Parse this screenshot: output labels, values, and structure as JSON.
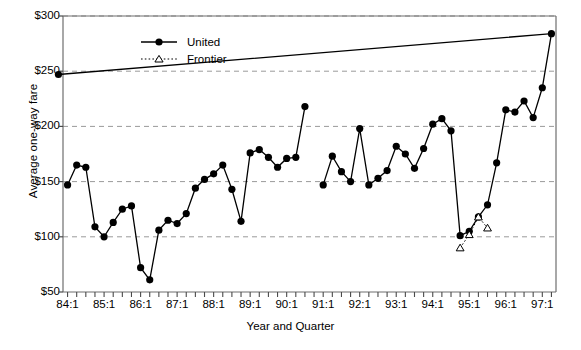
{
  "chart_data": {
    "type": "line",
    "title": "",
    "xlabel": "Year and Quarter",
    "ylabel": "Average one-way fare",
    "ylim": [
      50,
      300
    ],
    "yticks": [
      50,
      100,
      150,
      200,
      250,
      300
    ],
    "ytick_labels": [
      "$50",
      "$100",
      "$150",
      "$200",
      "$250",
      "$300"
    ],
    "grid": "horizontal-dashed",
    "legend_position": "top-center",
    "x_tick_labels": [
      "84:1",
      "85:1",
      "86:1",
      "87:1",
      "88:1",
      "89:1",
      "90:1",
      "91:1",
      "92:1",
      "93:1",
      "94:1",
      "95:1",
      "96:1",
      "97:1"
    ],
    "x_categories": [
      "84:1",
      "84:2",
      "84:3",
      "84:4",
      "85:1",
      "85:2",
      "85:3",
      "85:4",
      "86:1",
      "86:2",
      "86:3",
      "86:4",
      "87:1",
      "87:2",
      "87:3",
      "87:4",
      "88:1",
      "88:2",
      "88:3",
      "88:4",
      "89:1",
      "89:2",
      "89:3",
      "89:4",
      "90:1",
      "90:2",
      "90:3",
      "90:4",
      "91:1",
      "91:2",
      "91:3",
      "91:4",
      "92:1",
      "92:2",
      "92:3",
      "92:4",
      "93:1",
      "93:2",
      "93:3",
      "93:4",
      "94:1",
      "94:2",
      "94:3",
      "94:4",
      "95:1",
      "95:2",
      "95:3",
      "95:4",
      "96:1",
      "96:2",
      "96:3",
      "96:4",
      "97:1",
      "97:2"
    ],
    "series": [
      {
        "name": "United",
        "marker": "filled-circle",
        "line": "solid",
        "color": "#000000",
        "points": [
          {
            "x": "84:1",
            "y": 147
          },
          {
            "x": "84:2",
            "y": 165
          },
          {
            "x": "84:3",
            "y": 163
          },
          {
            "x": "84:4",
            "y": 109
          },
          {
            "x": "85:1",
            "y": 100
          },
          {
            "x": "85:2",
            "y": 113
          },
          {
            "x": "85:3",
            "y": 125
          },
          {
            "x": "85:4",
            "y": 128
          },
          {
            "x": "86:1",
            "y": 72
          },
          {
            "x": "86:2",
            "y": 61
          },
          {
            "x": "86:3",
            "y": 106
          },
          {
            "x": "86:4",
            "y": 115
          },
          {
            "x": "87:1",
            "y": 112
          },
          {
            "x": "87:2",
            "y": 121
          },
          {
            "x": "87:3",
            "y": 144
          },
          {
            "x": "87:4",
            "y": 152
          },
          {
            "x": "88:1",
            "y": 157
          },
          {
            "x": "88:2",
            "y": 165
          },
          {
            "x": "88:3",
            "y": 143
          },
          {
            "x": "88:4",
            "y": 114
          },
          {
            "x": "89:1",
            "y": 176
          },
          {
            "x": "89:2",
            "y": 179
          },
          {
            "x": "89:3",
            "y": 172
          },
          {
            "x": "89:4",
            "y": 163
          },
          {
            "x": "90:1",
            "y": 171
          },
          {
            "x": "90:2",
            "y": 172
          },
          {
            "x": "90:3",
            "y": 218
          }
        ],
        "points_segment2": [
          {
            "x": "91:1",
            "y": 147
          },
          {
            "x": "91:2",
            "y": 173
          },
          {
            "x": "91:3",
            "y": 159
          },
          {
            "x": "91:4",
            "y": 150
          },
          {
            "x": "92:1",
            "y": 198
          },
          {
            "x": "92:2",
            "y": 147
          },
          {
            "x": "92:3",
            "y": 153
          },
          {
            "x": "92:4",
            "y": 160
          },
          {
            "x": "93:1",
            "y": 182
          },
          {
            "x": "93:2",
            "y": 175
          },
          {
            "x": "93:3",
            "y": 162
          },
          {
            "x": "93:4",
            "y": 180
          },
          {
            "x": "94:1",
            "y": 202
          },
          {
            "x": "94:2",
            "y": 207
          },
          {
            "x": "94:3",
            "y": 196
          },
          {
            "x": "94:4",
            "y": 101
          },
          {
            "x": "95:1",
            "y": 105
          },
          {
            "x": "95:2",
            "y": 118
          },
          {
            "x": "95:3",
            "y": 129
          },
          {
            "x": "95:4",
            "y": 167
          },
          {
            "x": "96:1",
            "y": 215
          },
          {
            "x": "96:2",
            "y": 213
          },
          {
            "x": "96:3",
            "y": 223
          },
          {
            "x": "96:4",
            "y": 208
          },
          {
            "x": "97:1",
            "y": 235
          },
          {
            "x": "97:2",
            "y": 284
          },
          {
            "x": "97:3",
            "y": 247
          }
        ]
      },
      {
        "name": "Frontier",
        "marker": "open-triangle",
        "line": "dotted",
        "color": "#000000",
        "points": [
          {
            "x": "94:4",
            "y": 90
          },
          {
            "x": "95:1",
            "y": 102
          },
          {
            "x": "95:2",
            "y": 118
          },
          {
            "x": "95:3",
            "y": 108
          }
        ]
      }
    ]
  },
  "legend": {
    "items": [
      {
        "label": "United"
      },
      {
        "label": "Frontier"
      }
    ]
  }
}
